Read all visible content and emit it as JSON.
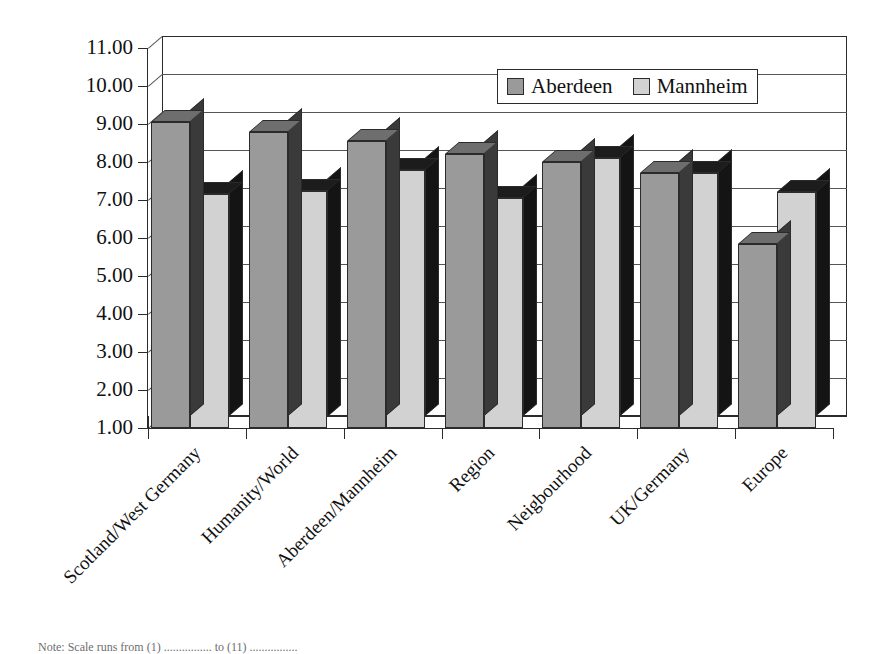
{
  "chart_data": {
    "type": "bar",
    "title": "",
    "subtitle": "",
    "xlabel": "",
    "ylabel": "",
    "ylim": [
      1.0,
      11.0
    ],
    "ytick_step": 1.0,
    "ytick_labels": [
      "11.00",
      "10.00",
      "9.00",
      "8.00",
      "7.00",
      "6.00",
      "5.00",
      "4.00",
      "3.00",
      "2.00",
      "1.00"
    ],
    "ytick_values": [
      11.0,
      10.0,
      9.0,
      8.0,
      7.0,
      6.0,
      5.0,
      4.0,
      3.0,
      2.0,
      1.0
    ],
    "grid": true,
    "grid_axis": "y",
    "style": "3d-clustered-column",
    "legend_position": "top-right-inside",
    "categories": [
      "Scotland/West Germany",
      "Humanity/World",
      "Aberdeen/Mannheim",
      "Region",
      "Neigbourhood",
      "UK/Germany",
      "Europe"
    ],
    "series": [
      {
        "name": "Aberdeen",
        "color": "#9a9a9a",
        "values": [
          9.05,
          8.8,
          8.55,
          8.2,
          8.0,
          7.7,
          5.85
        ]
      },
      {
        "name": "Mannheim",
        "color": "#d2d2d2",
        "values": [
          7.15,
          7.25,
          7.8,
          7.05,
          8.1,
          7.7,
          7.2
        ]
      }
    ]
  },
  "legend": {
    "entries": [
      {
        "label": "Aberdeen",
        "swatch": "dark-gray-swatch"
      },
      {
        "label": "Mannheim",
        "swatch": "light-gray-swatch"
      }
    ]
  },
  "footnote": {
    "text": "Note:  Scale runs from (1) ................ to (11) ................"
  }
}
